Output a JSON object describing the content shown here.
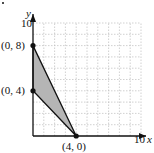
{
  "chart_data": {
    "type": "area",
    "title": "",
    "xlabel": "x",
    "ylabel": "y",
    "xlim": [
      0,
      10
    ],
    "ylim": [
      0,
      10
    ],
    "grid": true,
    "grid_step": 1,
    "tick_labels": {
      "x": [
        "10"
      ],
      "y": [
        "10"
      ]
    },
    "region": {
      "shape": "triangle",
      "vertices": [
        [
          0,
          8
        ],
        [
          0,
          4
        ],
        [
          4,
          0
        ]
      ],
      "fill": "#b5b5b5"
    },
    "points": [
      {
        "x": 0,
        "y": 8,
        "label": "(0, 8)"
      },
      {
        "x": 0,
        "y": 4,
        "label": "(0, 4)"
      },
      {
        "x": 4,
        "y": 0,
        "label": "(4, 0)"
      }
    ],
    "colors": {
      "axis": "#111111",
      "grid": "#bdbdbd",
      "fill": "#b5b5b5"
    }
  }
}
